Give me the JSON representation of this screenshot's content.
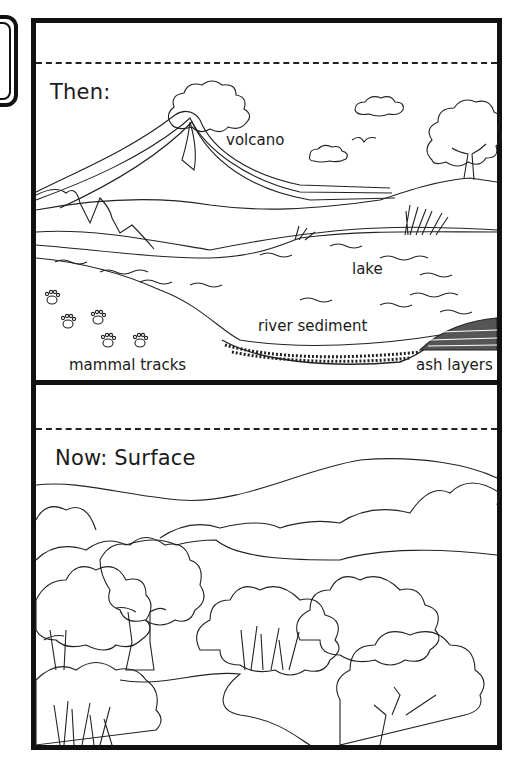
{
  "worksheet": {
    "panels": [
      {
        "id": "then",
        "heading": "Then:",
        "labels": {
          "volcano": "volcano",
          "lake": "lake",
          "river_sediment": "river sediment",
          "mammal_tracks": "mammal tracks",
          "ash_layers": "ash layers"
        }
      },
      {
        "id": "now",
        "heading": "Now: Surface"
      }
    ]
  },
  "colors": {
    "ink": "#111111",
    "paper": "#ffffff"
  }
}
